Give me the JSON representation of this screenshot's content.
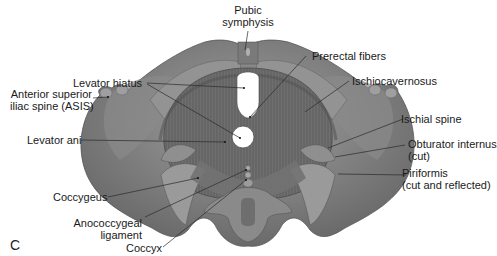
{
  "figure": {
    "panel_letter": "C",
    "colors": {
      "background": "#ffffff",
      "bone_light": "#9a9a9a",
      "bone_mid": "#7e7e7e",
      "bone_dark": "#5a5a5a",
      "muscle": "#6e6e6e",
      "muscle_fiber": "#585858",
      "hiatus": "#ffffff",
      "label_text": "#1a1a1a",
      "leader_line": "#2a2a2a"
    }
  },
  "labels": {
    "pubic_symphysis": [
      "Pubic",
      "symphysis"
    ],
    "prerectal_fibers": "Prerectal fibers",
    "levator_hiatus": "Levator hiatus",
    "ischiocavernosus": "Ischiocavernosus",
    "asis": [
      "Anterior superior",
      "iliac spine (ASIS)"
    ],
    "ischial_spine": "Ischial spine",
    "levator_ani": "Levator ani",
    "obturator_internus": [
      "Obturator internus",
      "(cut)"
    ],
    "piriformis": [
      "Piriformis",
      "(cut and reflected)"
    ],
    "coccygeus": "Coccygeus",
    "anococcygeal_ligament": [
      "Anococcygeal",
      "ligament"
    ],
    "coccyx": "Coccyx"
  }
}
